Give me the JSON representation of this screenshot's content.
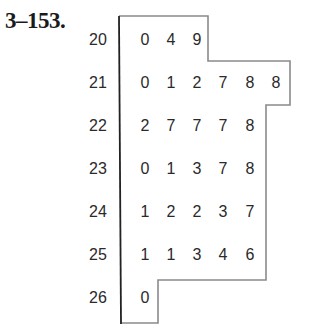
{
  "problem": {
    "number": "3–153."
  },
  "chart_data": {
    "type": "table",
    "subtype": "stem-and-leaf",
    "title": "",
    "stems": [
      "20",
      "21",
      "22",
      "23",
      "24",
      "25",
      "26"
    ],
    "rows": [
      {
        "stem": "20",
        "leaves": [
          "0",
          "4",
          "9"
        ]
      },
      {
        "stem": "21",
        "leaves": [
          "0",
          "1",
          "2",
          "7",
          "8",
          "8"
        ]
      },
      {
        "stem": "22",
        "leaves": [
          "2",
          "7",
          "7",
          "7",
          "8"
        ]
      },
      {
        "stem": "23",
        "leaves": [
          "0",
          "1",
          "3",
          "7",
          "8"
        ]
      },
      {
        "stem": "24",
        "leaves": [
          "1",
          "2",
          "2",
          "3",
          "7"
        ]
      },
      {
        "stem": "25",
        "leaves": [
          "1",
          "1",
          "3",
          "4",
          "6"
        ]
      },
      {
        "stem": "26",
        "leaves": [
          "0"
        ]
      }
    ],
    "values": [
      200,
      204,
      209,
      210,
      211,
      212,
      217,
      218,
      218,
      222,
      227,
      227,
      227,
      228,
      230,
      231,
      233,
      237,
      238,
      241,
      242,
      242,
      243,
      247,
      251,
      251,
      253,
      254,
      256,
      260
    ]
  },
  "colors": {
    "stem_line": "#222222",
    "outline": "#8a8a8a",
    "text": "#2a2a2a"
  }
}
